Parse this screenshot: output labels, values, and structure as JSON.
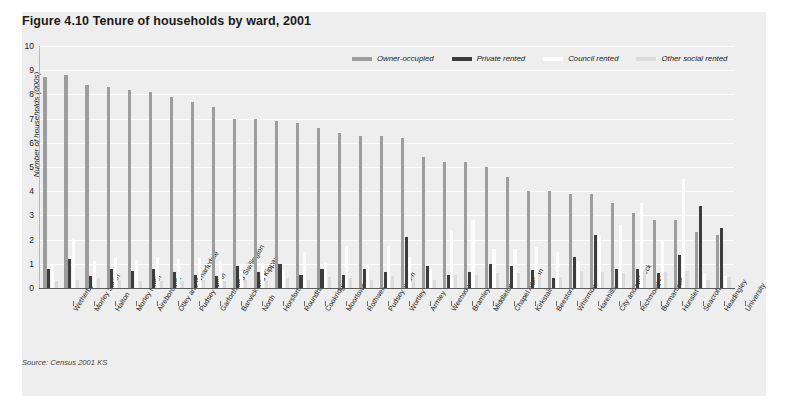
{
  "figure": {
    "title": "Figure 4.10  Tenure of households by ward, 2001",
    "source": "Source: Census 2001 KS"
  },
  "colors": {
    "panel_background": "#eeeeee",
    "owner_occupied": "#9d9d9d",
    "private_rented": "#3c3c3c",
    "council_rented": "#fdfdfd",
    "other_social_rented": "#dcdcdc",
    "gridline": "#ffffff",
    "axis": "#5a5a5a"
  },
  "chart_data": {
    "type": "bar",
    "title": "Figure 4.10  Tenure of households by ward, 2001",
    "subtitle": "",
    "xlabel": "",
    "ylabel": "Number of households (000s)",
    "ylim": [
      0,
      10
    ],
    "yticks": [
      0,
      1,
      2,
      3,
      4,
      5,
      6,
      7,
      8,
      9,
      10
    ],
    "ytick_labels": [
      "0",
      "1",
      "2",
      "3",
      "4",
      "5",
      "6",
      "7",
      "8",
      "9",
      "10"
    ],
    "grid": true,
    "legend_position": "top-right",
    "legend": [
      "Owner-occupied",
      "Private rented",
      "Council rented",
      "Other social rented"
    ],
    "categories": [
      "Wetherby",
      "Morley South",
      "Halton",
      "Morley North",
      "Aireborough",
      "Otley and Wharfedale",
      "Pudsey North",
      "Garforth and Swillington",
      "Barwick and Kippax",
      "North",
      "Horsforth",
      "Roundhay",
      "Cookridge",
      "Moortown",
      "Rothwell",
      "Pudsey South",
      "Wortley",
      "Armley",
      "Weetwood",
      "Bramley",
      "Middleton",
      "Chapel Allerton",
      "Kirkstall",
      "Beeston",
      "Whinmoor",
      "Harehills",
      "City and Holbeck",
      "Richmond Hill",
      "Burmantofts",
      "Hunslet",
      "Seacroft",
      "Headingley",
      "University"
    ],
    "series": [
      {
        "name": "Owner-occupied",
        "color": "#9d9d9d",
        "values": [
          8.7,
          8.8,
          8.4,
          8.3,
          8.2,
          8.1,
          7.9,
          7.7,
          7.5,
          7.0,
          7.0,
          6.9,
          6.8,
          6.6,
          6.4,
          6.3,
          6.3,
          6.2,
          5.4,
          5.2,
          5.2,
          5.0,
          4.6,
          4.0,
          4.0,
          3.9,
          3.9,
          3.5,
          3.1,
          2.8,
          2.8,
          2.3,
          2.2
        ]
      },
      {
        "name": "Private rented",
        "color": "#3c3c3c",
        "values": [
          0.8,
          1.2,
          0.5,
          0.8,
          0.7,
          0.8,
          0.65,
          0.55,
          0.5,
          0.9,
          0.65,
          1.0,
          0.55,
          0.8,
          0.55,
          0.8,
          0.65,
          2.1,
          0.9,
          0.55,
          0.65,
          1.0,
          0.9,
          0.75,
          0.4,
          1.3,
          2.2,
          0.8,
          0.8,
          0.6,
          1.35,
          3.4,
          2.5
        ]
      },
      {
        "name": "Council rented",
        "color": "#fdfdfd",
        "values": [
          0.95,
          2.05,
          1.1,
          1.25,
          1.15,
          1.3,
          1.2,
          1.25,
          1.1,
          0.95,
          1.05,
          0.75,
          1.5,
          1.05,
          1.75,
          1.0,
          1.75,
          1.3,
          0.8,
          2.4,
          2.8,
          1.6,
          1.6,
          1.7,
          1.5,
          1.1,
          2.2,
          2.6,
          3.5,
          2.0,
          4.5,
          0.6,
          0.5
        ]
      },
      {
        "name": "Other social rented",
        "color": "#dcdcdc",
        "values": [
          0.3,
          0.35,
          0.4,
          0.35,
          0.3,
          0.3,
          0.3,
          0.35,
          0.3,
          0.35,
          0.3,
          0.4,
          0.35,
          0.45,
          0.4,
          0.35,
          0.5,
          0.45,
          0.35,
          0.55,
          0.55,
          0.6,
          0.6,
          0.55,
          0.45,
          0.7,
          0.65,
          0.6,
          0.75,
          0.65,
          0.7,
          0.35,
          0.45
        ]
      }
    ]
  }
}
